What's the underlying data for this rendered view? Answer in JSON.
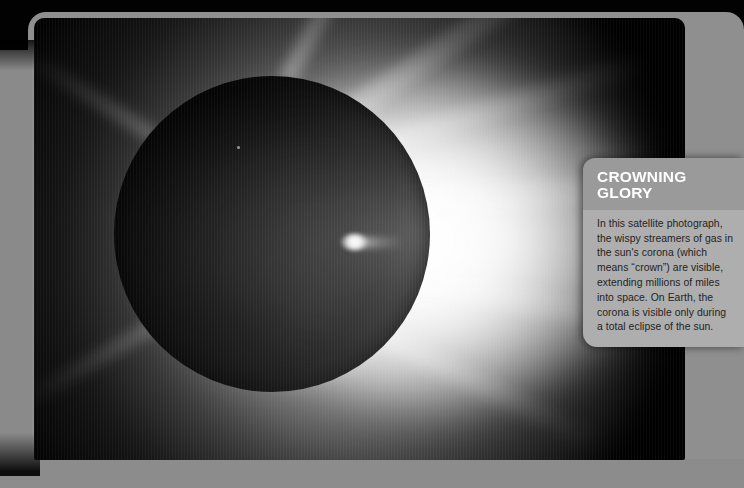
{
  "page": {
    "kind": "printed-magazine-page",
    "background_color": "#020202",
    "paper_color": "#8f8f8f"
  },
  "photo": {
    "name": "solar-eclipse-corona-photograph",
    "subject": "total solar eclipse showing the sun's corona",
    "background_color": "#000000",
    "corona_color": "#ffffff",
    "disk_color": "#050505",
    "features": [
      "dark occulting lunar disk",
      "bright chromosphere ring",
      "wispy coronal streamers extending right",
      "bright solar prominence near disk centre-right"
    ]
  },
  "callout": {
    "title": "CROWNING\nGLORY",
    "body": "In this satellite photograph, the wispy streamers of gas in the sun's corona (which means “crown”) are visible, extending millions of miles into space. On Earth, the corona is visible only during a total eclipse of the sun.",
    "title_background": "#9a9a9a",
    "body_background": "#aeaeae",
    "title_color": "#ffffff",
    "body_color": "#232323"
  }
}
